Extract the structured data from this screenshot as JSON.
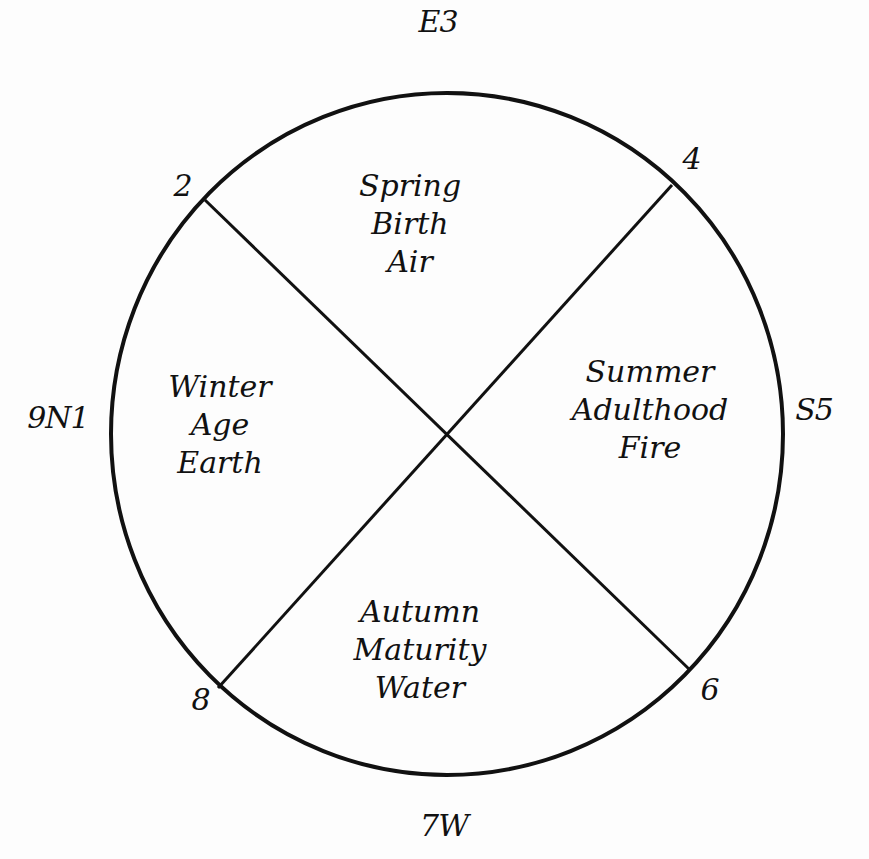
{
  "diagram": {
    "type": "medicine-wheel",
    "circle": {
      "cx": 447,
      "cy": 434,
      "rx": 336,
      "ry": 341,
      "stroke": "#111111"
    },
    "background": "#fdfdfd",
    "directions": {
      "top": "E3",
      "left": "9N1",
      "right": "S5",
      "bottom": "7W"
    },
    "points": {
      "upper_left": "2",
      "upper_right": "4",
      "lower_right": "6",
      "lower_left": "8"
    },
    "quadrants": {
      "top": {
        "season": "Spring",
        "life_stage": "Birth",
        "element": "Air"
      },
      "right": {
        "season": "Summer",
        "life_stage": "Adulthood",
        "element": "Fire"
      },
      "bottom": {
        "season": "Autumn",
        "life_stage": "Maturity",
        "element": "Water"
      },
      "left": {
        "season": "Winter",
        "life_stage": "Age",
        "element": "Earth"
      }
    }
  }
}
